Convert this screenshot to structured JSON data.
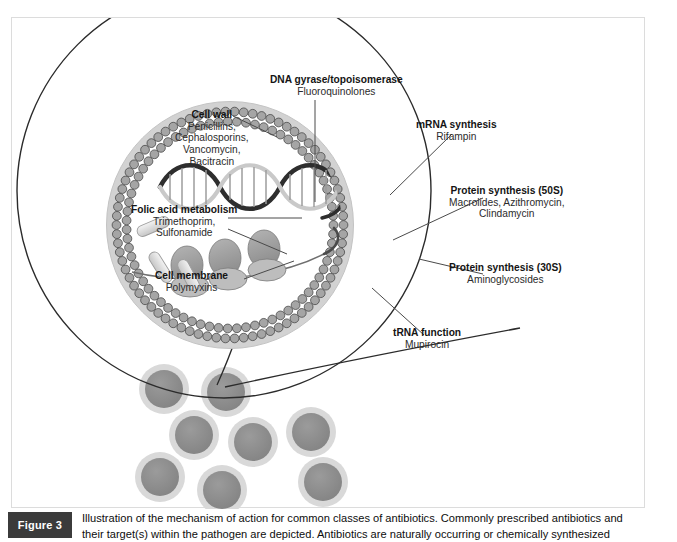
{
  "figure": {
    "badge_label": "Figure 3",
    "caption_lines": [
      "Illustration of the mechanism of action for common classes of antibiotics. Commonly prescribed antibiotics and",
      "their target(s) within the pathogen are depicted. Antibiotics are naturally occurring or chemically synthesized"
    ]
  },
  "diagram": {
    "title": "Mechanism of action for common classes of antibiotics",
    "labels": [
      {
        "id": "dna-gyrase",
        "target": "DNA gyrase/topoisomerase",
        "drugs": [
          "Fluoroquinolones"
        ]
      },
      {
        "id": "cell-wall",
        "target": "Cell wall",
        "drugs": [
          "Penicillins,",
          "Cephalosporins,",
          "Vancomycin,",
          "Bacitracin"
        ]
      },
      {
        "id": "folic-acid",
        "target": "Folic acid metabolism",
        "drugs": [
          "Trimethoprim,",
          "Sulfonamide"
        ]
      },
      {
        "id": "cell-membrane",
        "target": "Cell membrane",
        "drugs": [
          "Polymyxins"
        ]
      },
      {
        "id": "mrna",
        "target": "mRNA synthesis",
        "drugs": [
          "Rifampin"
        ]
      },
      {
        "id": "protein-50s",
        "target": "Protein synthesis (50S)",
        "drugs": [
          "Macrolides, Azithromycin,",
          "Clindamycin"
        ]
      },
      {
        "id": "protein-30s",
        "target": "Protein synthesis (30S)",
        "drugs": [
          "Aminoglycosides"
        ]
      },
      {
        "id": "trna",
        "target": "tRNA function",
        "drugs": [
          "Mupirocin"
        ]
      }
    ],
    "structures": {
      "magnifier_circle": "magnified-bacterium-view",
      "cell_wall_ring": "cell-wall",
      "membrane_bilayer": "phospholipid-bilayer",
      "dna_helix": "dna-double-helix",
      "ribosomes": "ribosomes-on-mrna",
      "plasmids": "rod-shaped-bodies",
      "bacteria_count": 8
    },
    "colors": {
      "outline": "#2b2b2b",
      "wall_halo": "#d0d0d0",
      "membrane_fill": "#9a9a9a",
      "bacteria_fill": "#8c8c8c",
      "bacteria_halo": "#d6d6d6",
      "badge_bg": "#3b3b3b",
      "panel_border": "#dcdcdc"
    }
  }
}
